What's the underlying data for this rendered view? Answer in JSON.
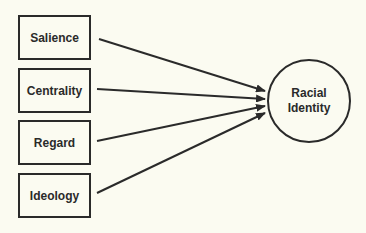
{
  "diagram": {
    "type": "path-diagram",
    "sources": [
      {
        "id": "salience",
        "label": "Salience"
      },
      {
        "id": "centrality",
        "label": "Centrality"
      },
      {
        "id": "regard",
        "label": "Regard"
      },
      {
        "id": "ideology",
        "label": "Ideology"
      }
    ],
    "target": {
      "id": "racial-identity",
      "label_line1": "Racial",
      "label_line2": "Identity"
    },
    "edges": [
      {
        "from": "salience",
        "to": "racial-identity"
      },
      {
        "from": "centrality",
        "to": "racial-identity"
      },
      {
        "from": "regard",
        "to": "racial-identity"
      },
      {
        "from": "ideology",
        "to": "racial-identity"
      }
    ],
    "colors": {
      "stroke": "#2a2a2a",
      "background": "#fbfbf1"
    }
  }
}
